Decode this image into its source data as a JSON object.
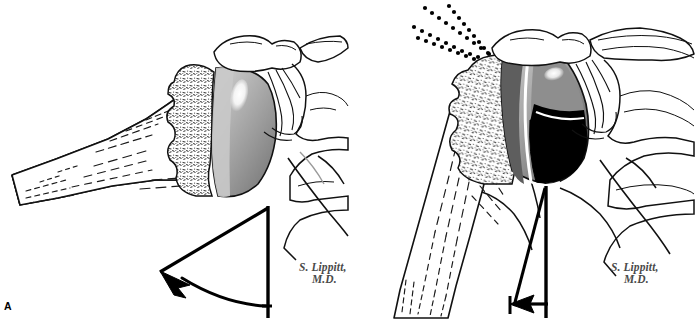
{
  "figure": {
    "panel_label": "A",
    "background_color": "#ffffff",
    "ink_color": "#000000",
    "width_px": 695,
    "height_px": 321,
    "signature": {
      "line1": "S. Lippitt,",
      "line2": "M.D.",
      "color": "#4a4a4a",
      "style": "italic"
    },
    "panels": [
      {
        "id": "left",
        "position": "left",
        "caption_none": "",
        "humeral_head": {
          "shape": "spherical",
          "label": "normal rounded humeral head",
          "gradient_light": "#c2c2c2",
          "gradient_mid": "#a0a0a0",
          "gradient_dark": "#7d7d7d",
          "highlight_color": "#ffffff"
        },
        "humerus_shaft": {
          "orientation": "abducted / near-horizontal",
          "trabecular_lines": "dashed"
        },
        "cancellous_bone": {
          "pattern": "stippled",
          "fill": "#ffffff",
          "speckle_color": "#333333"
        },
        "motion_indicator": {
          "type": "angle-with-curved-arrow",
          "描述": "wide arc",
          "label": "large arc of motion",
          "angle_degrees": 52,
          "arrow_direction": "counterclockwise sweep to upper-left"
        },
        "signature_visible": true
      },
      {
        "id": "right",
        "position": "right",
        "humeral_head": {
          "shape": "flattened wedge / eroded",
          "label": "wedge-shaped humeral head with loss of sphericity",
          "gradient_light": "#c8c8c8",
          "gradient_mid": "#8e8e8e",
          "gradient_dark": "#5a5a5a",
          "shadow_fill": "#000000",
          "highlight_color": "#ffffff"
        },
        "humerus_shaft": {
          "orientation": "adducted / near-vertical",
          "trabecular_lines": "dashed"
        },
        "cancellous_bone": {
          "pattern": "stippled",
          "fill": "#ffffff",
          "speckle_color": "#333333"
        },
        "impingement_rays": {
          "type": "dotted-rays",
          "count": 4,
          "label": "superior contact / impingement force lines",
          "color": "#000000"
        },
        "motion_indicator": {
          "type": "angle-with-straight-arrow",
          "label": "restricted arc of motion",
          "angle_degrees": 11,
          "arrow_direction": "horizontal arrowhead to left at base"
        },
        "signature_visible": true
      }
    ]
  }
}
